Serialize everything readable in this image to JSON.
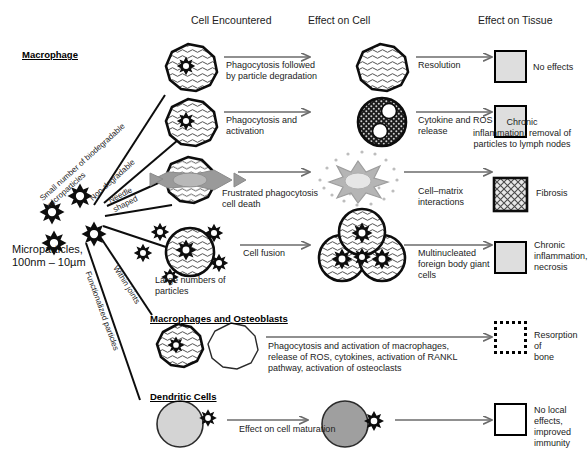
{
  "diagram": {
    "column_headers": [
      {
        "label": "Cell Encountered",
        "x": 191,
        "y": 14
      },
      {
        "label": "Effect on Cell",
        "x": 308,
        "y": 14
      },
      {
        "label": "Effect on Tissue",
        "x": 478,
        "y": 14
      }
    ],
    "source_label": "Microparticles,\n100nm – 10µm",
    "group_headers": [
      {
        "label": "Macrophage",
        "x": 22,
        "y": 49
      },
      {
        "label": "Macrophages and Osteoblasts",
        "x": 150,
        "y": 315
      },
      {
        "label": "Dendritic Cells",
        "x": 150,
        "y": 393
      }
    ],
    "branch_labels": [
      {
        "label": "Small number of biodegradable\nmicroparticles",
        "angle": -42
      },
      {
        "label": "Non-degradable",
        "angle": -42
      },
      {
        "label": "Needle\nshaped",
        "angle": -27
      },
      {
        "label": "Within joints",
        "angle": 58
      },
      {
        "label": "Functionalized particles",
        "angle": 70
      }
    ],
    "cell_captions": [
      {
        "label": "Large numbers of\nparticles",
        "x": 155,
        "y": 277
      }
    ],
    "rows": [
      {
        "id": "row-resolution",
        "cell_encountered": "macrophage-with-particle",
        "arrow1_label": "Phagocytosis followed\nby particle degradation",
        "effect_on_cell": "macrophage-degraded-particle",
        "arrow2_label": "Resolution",
        "tissue_style": "gray",
        "tissue_label": "No effects"
      },
      {
        "id": "row-chronic-inflammation",
        "cell_encountered": "macrophage-with-particle",
        "arrow1_label": "Phagocytosis and\nactivation",
        "effect_on_cell": "activated-macrophage-vacuoles",
        "arrow2_label": "Cytokine and ROS\nrelease",
        "tissue_style": "gray",
        "tissue_label": "Chronic\ninflammation, removal of\nparticles to lymph nodes"
      },
      {
        "id": "row-fibrosis",
        "cell_encountered": "macrophage-pierced-by-needle",
        "arrow1_label": "Frustrated phagocytosis\ncell death",
        "effect_on_cell": "dying-cell-debris",
        "arrow2_label": "Cell–matrix\ninteractions",
        "tissue_style": "hatched",
        "tissue_label": "Fibrosis"
      },
      {
        "id": "row-giant-cells",
        "cell_encountered": "macrophage-with-many-particles",
        "arrow1_label": "Cell fusion",
        "effect_on_cell": "multinucleated-giant-cell",
        "arrow2_label": "Multinucleated\nforeign body giant\ncells",
        "tissue_style": "gray",
        "tissue_label": "Chronic\ninflammation,\nnecrosis"
      },
      {
        "id": "row-bone-resorption",
        "cell_encountered": "macrophage-and-osteoblast",
        "arrow1_label": "Phagocytosis and activation of macrophages,\nrelease of ROS, cytokines, activation of RANKL\npathway, activation of osteoclasts",
        "effect_on_cell": "",
        "arrow2_label": "",
        "tissue_style": "dotted",
        "tissue_label": "Resorption of\nbone"
      },
      {
        "id": "row-dendritic",
        "cell_encountered": "dendritic-cell-light",
        "arrow1_label": "Effect on cell maturation",
        "effect_on_cell": "dendritic-cell-mature",
        "arrow2_label": "",
        "tissue_style": "white",
        "tissue_label": "No local\neffects,\nimproved\nimmunity"
      }
    ],
    "colors": {
      "ink": "#111111",
      "arrow": "#6b6b6b",
      "tissue_gray": "#dedede",
      "needle_gray": "#9a9a9a",
      "dendritic_light": "#d4d4d4",
      "dendritic_mature": "#9f9f9f",
      "dying_cell": "#cfcfcf"
    }
  }
}
